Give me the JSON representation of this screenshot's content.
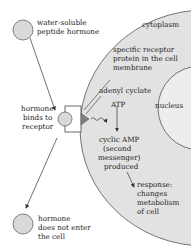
{
  "diagram": {
    "colors": {
      "cell_fill": "#e2e2e2",
      "nucleus_fill": "#ededed",
      "hormone_fill": "#d9d9d9",
      "receptor_fill": "#ffffff",
      "enzyme_fill": "#808080",
      "stroke": "#555555",
      "text": "#222222"
    },
    "labels": {
      "hormone_top_1": "water-soluble",
      "hormone_top_2": "peptide hormone",
      "cytoplasm": "cytoplasm",
      "receptor_1": "specific receptor",
      "receptor_2": "protein in the cell",
      "receptor_3": "membrane",
      "adenyl_cyclate": "adenyl cyclate",
      "atp": "ATP",
      "nucleus": "nucleus",
      "binds_1": "hormone",
      "binds_2": "binds to",
      "binds_3": "receptor",
      "camp_1": "cyclic AMP",
      "camp_2": "(second",
      "camp_3": "messenger)",
      "camp_4": "produced",
      "response_1": "response:",
      "response_2": "changes",
      "response_3": "metabolism",
      "response_4": "of cell",
      "notenter_1": "hormone",
      "notenter_2": "does not enter",
      "notenter_3": "the cell"
    }
  }
}
